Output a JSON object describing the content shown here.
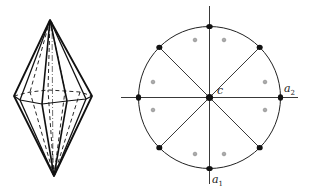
{
  "figure": {
    "left": {
      "name": "hexagonal-bipyramid-crystal-drawing",
      "description": "Ditetragonal dipyramid crystal solid (perspective line drawing with hidden edges dashed)"
    },
    "right": {
      "name": "stereographic-projection",
      "labels": {
        "center": "c",
        "axis_horizontal": "a",
        "axis_horizontal_sub": "2",
        "axis_vertical": "a",
        "axis_vertical_sub": "1"
      },
      "circle_poles_count": 8,
      "interior_poles_count": 8
    }
  }
}
